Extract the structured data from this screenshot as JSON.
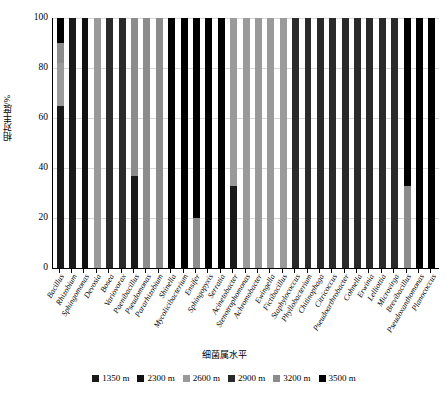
{
  "chart_data": {
    "type": "bar",
    "subtype": "stacked-100-percent",
    "title": "",
    "xlabel": "细菌属水平",
    "ylabel": "相对丰度/%",
    "ylim": [
      0,
      100
    ],
    "yticks": [
      0,
      20,
      40,
      60,
      80,
      100
    ],
    "grid": true,
    "legend_position": "bottom",
    "categories": [
      "Bacillus",
      "Rhizobium",
      "Sphingomonas",
      "Devosia",
      "Bosea",
      "Variovorax",
      "Paenibacillus",
      "Pseudomonas",
      "Pararhizobium",
      "Shinella",
      "Mycolicibacterium",
      "Ensifer",
      "Sphingopyxis",
      "Serratia",
      "Acinetobacter",
      "Stenotrophomonas",
      "Achromobacter",
      "Ewingella",
      "Fictibacillus",
      "Staphylococcus",
      "Phyllobacterium",
      "Chitinophaga",
      "Citricoccus",
      "Pseudoarthrobacter",
      "Cohnella",
      "Erwinia",
      "Lelliottia",
      "Microvirga",
      "Brevibacillus",
      "Pseudoxanthomonas",
      "Planococcus"
    ],
    "series": [
      {
        "name": "1350 m",
        "color": "#1a1a1a",
        "values": [
          65,
          100,
          0,
          0,
          0,
          0,
          37,
          0,
          0,
          0,
          0,
          0,
          0,
          0,
          33,
          0,
          0,
          0,
          0,
          0,
          0,
          0,
          0,
          0,
          0,
          0,
          0,
          0,
          0,
          0,
          0
        ]
      },
      {
        "name": "2300 m",
        "color": "#111111",
        "values": [
          0,
          0,
          100,
          0,
          0,
          0,
          0,
          0,
          0,
          0,
          0,
          0,
          0,
          0,
          0,
          0,
          0,
          0,
          0,
          0,
          0,
          0,
          0,
          0,
          0,
          0,
          0,
          0,
          0,
          0,
          0
        ]
      },
      {
        "name": "2600 m",
        "color": "#9a9a9a",
        "values": [
          17,
          0,
          0,
          100,
          0,
          0,
          0,
          0,
          0,
          0,
          0,
          0,
          0,
          0,
          67,
          100,
          100,
          100,
          100,
          0,
          0,
          0,
          0,
          0,
          0,
          0,
          0,
          0,
          0,
          0,
          0
        ]
      },
      {
        "name": "2900 m",
        "color": "#2a2a2a",
        "values": [
          0,
          0,
          0,
          0,
          100,
          100,
          0,
          0,
          0,
          0,
          0,
          0,
          0,
          0,
          0,
          0,
          0,
          0,
          0,
          100,
          100,
          100,
          100,
          100,
          100,
          100,
          100,
          100,
          0,
          0,
          0
        ]
      },
      {
        "name": "3200 m",
        "color": "#8c8c8c",
        "values": [
          8,
          0,
          0,
          0,
          0,
          0,
          63,
          100,
          100,
          0,
          0,
          20,
          0,
          0,
          0,
          0,
          0,
          0,
          0,
          0,
          0,
          0,
          0,
          0,
          0,
          0,
          0,
          0,
          33,
          0,
          0
        ]
      },
      {
        "name": "3500 m",
        "color": "#000000",
        "values": [
          10,
          0,
          0,
          0,
          0,
          0,
          0,
          0,
          0,
          100,
          100,
          80,
          100,
          100,
          0,
          0,
          0,
          0,
          0,
          0,
          0,
          0,
          0,
          0,
          0,
          0,
          0,
          0,
          67,
          100,
          100
        ]
      }
    ]
  }
}
